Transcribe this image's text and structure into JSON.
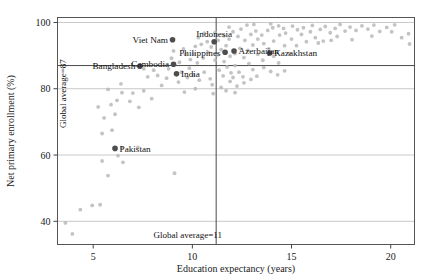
{
  "figure": {
    "bleed_text": "· · · · ·"
  },
  "chart_data": {
    "type": "scatter",
    "title": "",
    "xlabel": "Education expectancy (years)",
    "ylabel": "Net primary enrollment (%)",
    "xlim": [
      3.2,
      21.2
    ],
    "ylim": [
      33,
      101.5
    ],
    "xticks": [
      5,
      10,
      15,
      20
    ],
    "xtick_labels": [
      "5",
      "10",
      "15",
      "20"
    ],
    "yticks": [
      40,
      60,
      80,
      100
    ],
    "ytick_labels": [
      "40",
      "60",
      "80",
      "100"
    ],
    "grid": "horizontal-only",
    "legend": "none",
    "reference_lines": [
      {
        "name": "global-average-enrollment",
        "orientation": "horizontal",
        "value": 87,
        "label": "Global average=87",
        "label_orientation": "vertical"
      },
      {
        "name": "global-average-education-expectancy",
        "orientation": "vertical",
        "value": 11.2,
        "label": "Global average=11",
        "label_orientation": "horizontal"
      }
    ],
    "highlighted_color": "#4d4d4d",
    "background_color": "#b9b9b9",
    "highlighted": [
      {
        "label": "Bangladesh",
        "x": 7.35,
        "y": 86.8,
        "label_side": "left"
      },
      {
        "label": "Cambodia",
        "x": 9.05,
        "y": 87.4,
        "label_side": "left"
      },
      {
        "label": "India",
        "x": 9.2,
        "y": 84.5,
        "label_side": "right"
      },
      {
        "label": "Viet Nam",
        "x": 9.0,
        "y": 94.8,
        "label_side": "left"
      },
      {
        "label": "Indonesia",
        "x": 11.1,
        "y": 94.2,
        "label_side": "above"
      },
      {
        "label": "Philippines",
        "x": 11.65,
        "y": 91.0,
        "label_side": "left"
      },
      {
        "label": "Azerbaijan",
        "x": 12.1,
        "y": 91.4,
        "label_side": "right"
      },
      {
        "label": "Kazakhstan",
        "x": 13.9,
        "y": 90.8,
        "label_side": "right"
      },
      {
        "label": "Pakistan",
        "x": 6.1,
        "y": 62.0,
        "label_side": "right"
      }
    ],
    "others": [
      [
        3.6,
        39.5
      ],
      [
        3.95,
        36.2
      ],
      [
        4.35,
        43.5
      ],
      [
        4.95,
        44.8
      ],
      [
        5.35,
        45.0
      ],
      [
        5.45,
        58.2
      ],
      [
        5.75,
        53.8
      ],
      [
        6.25,
        59.8
      ],
      [
        6.5,
        57.8
      ],
      [
        6.45,
        62.2
      ],
      [
        7.25,
        62.3
      ],
      [
        9.1,
        54.5
      ],
      [
        5.45,
        66.5
      ],
      [
        5.95,
        67.5
      ],
      [
        5.55,
        71.2
      ],
      [
        6.1,
        72.3
      ],
      [
        5.25,
        74.5
      ],
      [
        5.9,
        75.2
      ],
      [
        6.2,
        76.5
      ],
      [
        6.85,
        76.2
      ],
      [
        7.3,
        74.4
      ],
      [
        7.0,
        78.7
      ],
      [
        6.45,
        78.8
      ],
      [
        5.75,
        79.8
      ],
      [
        6.4,
        81.5
      ],
      [
        7.55,
        79.4
      ],
      [
        7.95,
        77.0
      ],
      [
        8.45,
        81.0
      ],
      [
        8.7,
        83.2
      ],
      [
        9.3,
        82.0
      ],
      [
        9.6,
        79.0
      ],
      [
        10.05,
        84.2
      ],
      [
        10.35,
        82.6
      ],
      [
        10.6,
        85.0
      ],
      [
        10.9,
        83.0
      ],
      [
        11.05,
        78.5
      ],
      [
        11.0,
        81.2
      ],
      [
        9.85,
        86.2
      ],
      [
        10.25,
        87.8
      ],
      [
        10.55,
        89.3
      ],
      [
        10.8,
        91.0
      ],
      [
        10.95,
        92.6
      ],
      [
        11.15,
        88.6
      ],
      [
        11.35,
        85.6
      ],
      [
        11.55,
        83.9
      ],
      [
        11.75,
        86.6
      ],
      [
        11.95,
        84.8
      ],
      [
        11.6,
        88.2
      ],
      [
        11.9,
        89.8
      ],
      [
        12.15,
        87.0
      ],
      [
        12.35,
        85.0
      ],
      [
        12.55,
        83.6
      ],
      [
        12.15,
        90.6
      ],
      [
        12.4,
        92.2
      ],
      [
        12.6,
        89.4
      ],
      [
        12.85,
        87.6
      ],
      [
        13.05,
        85.8
      ],
      [
        12.8,
        91.6
      ],
      [
        13.05,
        93.2
      ],
      [
        13.3,
        90.4
      ],
      [
        13.55,
        88.6
      ],
      [
        13.3,
        95.0
      ],
      [
        13.6,
        93.6
      ],
      [
        13.85,
        92.0
      ],
      [
        14.1,
        89.8
      ],
      [
        14.35,
        87.8
      ],
      [
        14.1,
        94.4
      ],
      [
        14.4,
        96.2
      ],
      [
        14.65,
        93.0
      ],
      [
        14.9,
        90.6
      ],
      [
        14.7,
        96.8
      ],
      [
        15.0,
        95.0
      ],
      [
        15.25,
        93.0
      ],
      [
        15.5,
        96.4
      ],
      [
        15.75,
        94.2
      ],
      [
        15.3,
        97.8
      ],
      [
        15.6,
        98.4
      ],
      [
        15.95,
        97.2
      ],
      [
        16.2,
        95.4
      ],
      [
        16.45,
        97.9
      ],
      [
        16.05,
        99.1
      ],
      [
        16.7,
        98.8
      ],
      [
        16.95,
        96.9
      ],
      [
        17.2,
        98.2
      ],
      [
        17.45,
        99.4
      ],
      [
        17.0,
        94.6
      ],
      [
        17.7,
        97.4
      ],
      [
        17.95,
        98.6
      ],
      [
        18.25,
        97.6
      ],
      [
        18.55,
        99.0
      ],
      [
        18.85,
        98.0
      ],
      [
        19.15,
        99.2
      ],
      [
        19.45,
        97.3
      ],
      [
        19.8,
        98.5
      ],
      [
        20.2,
        99.3
      ],
      [
        20.55,
        95.4
      ],
      [
        20.9,
        96.6
      ],
      [
        20.95,
        93.5
      ],
      [
        9.05,
        91.4
      ],
      [
        9.55,
        92.0
      ],
      [
        10.05,
        90.5
      ],
      [
        10.45,
        93.4
      ],
      [
        11.3,
        94.6
      ],
      [
        11.6,
        96.0
      ],
      [
        11.85,
        95.0
      ],
      [
        12.3,
        95.8
      ],
      [
        12.65,
        94.6
      ],
      [
        12.95,
        96.4
      ],
      [
        13.2,
        97.4
      ],
      [
        13.5,
        96.2
      ],
      [
        13.8,
        97.6
      ],
      [
        14.05,
        98.4
      ],
      [
        14.35,
        99.0
      ],
      [
        14.6,
        98.2
      ],
      [
        12.05,
        97.2
      ],
      [
        12.45,
        98.0
      ],
      [
        11.7,
        93.0
      ],
      [
        11.45,
        91.8
      ],
      [
        11.25,
        90.2
      ],
      [
        10.75,
        94.2
      ],
      [
        11.85,
        98.6
      ],
      [
        10.6,
        96.8
      ],
      [
        10.3,
        95.4
      ],
      [
        11.15,
        97.0
      ],
      [
        11.9,
        82.2
      ],
      [
        12.25,
        80.8
      ],
      [
        12.6,
        81.8
      ],
      [
        12.95,
        82.8
      ],
      [
        13.25,
        83.8
      ],
      [
        11.45,
        80.4
      ],
      [
        11.7,
        79.4
      ],
      [
        12.15,
        78.8
      ],
      [
        12.05,
        83.4
      ],
      [
        13.6,
        86.4
      ],
      [
        13.95,
        85.2
      ],
      [
        14.3,
        84.2
      ],
      [
        14.65,
        85.4
      ],
      [
        8.25,
        84.0
      ],
      [
        8.8,
        86.0
      ],
      [
        9.45,
        85.0
      ],
      [
        9.75,
        83.4
      ],
      [
        10.15,
        80.0
      ],
      [
        7.75,
        83.6
      ],
      [
        8.05,
        85.6
      ],
      [
        7.55,
        86.0
      ],
      [
        9.9,
        88.8
      ],
      [
        9.35,
        88.0
      ],
      [
        8.95,
        89.2
      ],
      [
        9.65,
        90.4
      ],
      [
        10.15,
        92.8
      ],
      [
        12.75,
        99.2
      ],
      [
        13.1,
        99.4
      ],
      [
        13.95,
        99.6
      ],
      [
        16.35,
        93.8
      ],
      [
        17.3,
        95.8
      ],
      [
        15.05,
        98.9
      ],
      [
        18.05,
        94.8
      ],
      [
        19.05,
        95.9
      ],
      [
        20.05,
        97.2
      ],
      [
        16.6,
        94.4
      ]
    ]
  }
}
